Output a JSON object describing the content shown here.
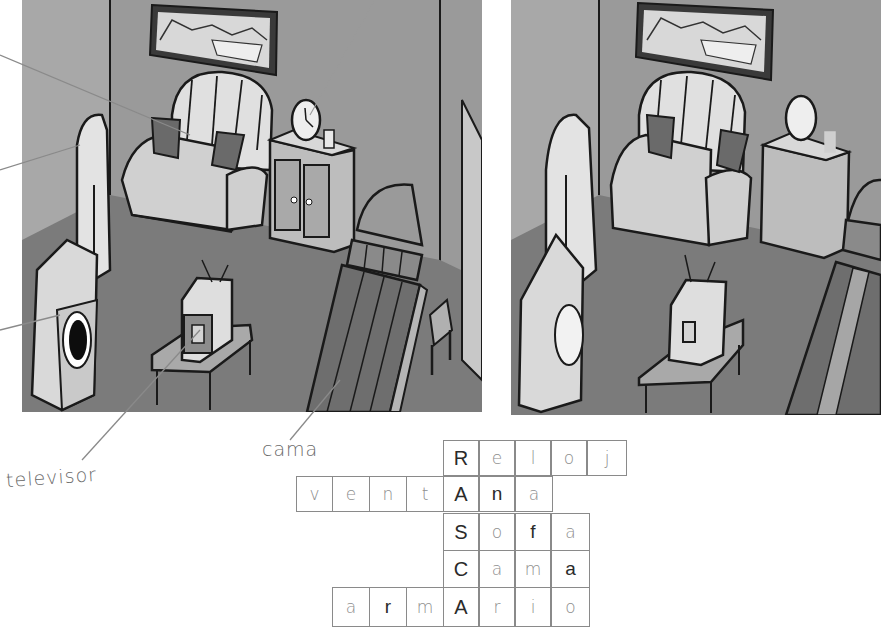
{
  "worksheet": {
    "labels": {
      "televisor": "televisor",
      "cama": "cama"
    },
    "panels": [
      {
        "name": "room-original",
        "items": [
          "cuadro",
          "sofa",
          "reloj",
          "vaso",
          "armario",
          "ventana",
          "lavadora",
          "television",
          "mesa",
          "cama",
          "silla"
        ]
      },
      {
        "name": "room-differences",
        "items": [
          "cuadro",
          "sofa",
          "reloj",
          "vaso",
          "armario",
          "lavadora",
          "television",
          "mesa",
          "cama"
        ]
      }
    ],
    "crossword": {
      "key_word": "RASCA",
      "rows": [
        {
          "word": "Reloj",
          "cells": [
            {
              "ch": "R",
              "type": "key"
            },
            {
              "ch": "e",
              "type": "hw"
            },
            {
              "ch": "l",
              "type": "hw"
            },
            {
              "ch": "o",
              "type": "hw"
            },
            {
              "ch": "j",
              "type": "hw"
            }
          ]
        },
        {
          "word": "ventAna",
          "cells": [
            {
              "ch": "v",
              "type": "hw"
            },
            {
              "ch": "e",
              "type": "hw"
            },
            {
              "ch": "n",
              "type": "hw"
            },
            {
              "ch": "t",
              "type": "hw"
            },
            {
              "ch": "A",
              "type": "key"
            },
            {
              "ch": "n",
              "type": "printed"
            },
            {
              "ch": "a",
              "type": "hw"
            }
          ]
        },
        {
          "word": "Sofa",
          "cells": [
            {
              "ch": "S",
              "type": "key"
            },
            {
              "ch": "o",
              "type": "hw"
            },
            {
              "ch": "f",
              "type": "printed"
            },
            {
              "ch": "a",
              "type": "hw"
            }
          ]
        },
        {
          "word": "Cama",
          "cells": [
            {
              "ch": "C",
              "type": "key"
            },
            {
              "ch": "a",
              "type": "hw"
            },
            {
              "ch": "m",
              "type": "hw"
            },
            {
              "ch": "a",
              "type": "printed"
            }
          ]
        },
        {
          "word": "armArio",
          "cells": [
            {
              "ch": "a",
              "type": "hw"
            },
            {
              "ch": "r",
              "type": "printed"
            },
            {
              "ch": "m",
              "type": "hw"
            },
            {
              "ch": "A",
              "type": "key"
            },
            {
              "ch": "r",
              "type": "hw"
            },
            {
              "ch": "i",
              "type": "hw"
            },
            {
              "ch": "o",
              "type": "hw"
            }
          ]
        }
      ]
    },
    "colors": {
      "wall": "#9c9c9c",
      "floor": "#7d7d7d",
      "furniture_light": "#dcdcdc",
      "outline": "#1a1a1a",
      "pencil": "#8a8a8a"
    }
  }
}
